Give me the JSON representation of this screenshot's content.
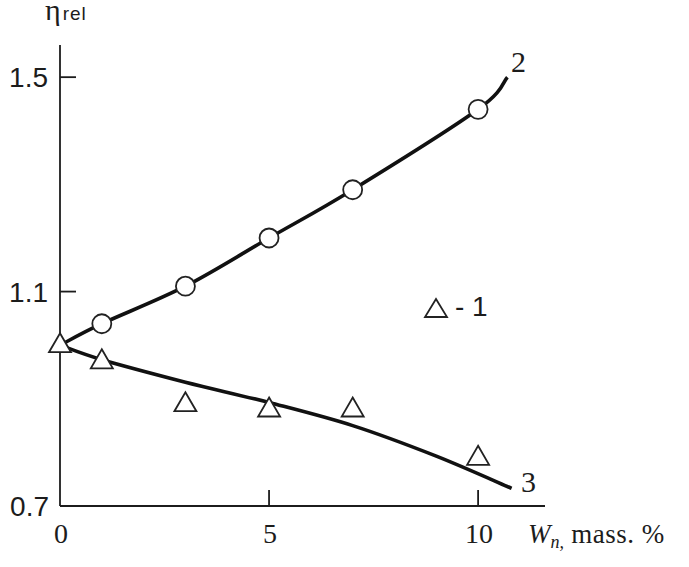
{
  "chart_data": {
    "type": "line",
    "title": "",
    "xlabel": "W_n, mass. %",
    "ylabel": "η_rel",
    "xlim": [
      0,
      11.6
    ],
    "ylim": [
      0.7,
      1.56
    ],
    "grid": false,
    "x_ticks": [
      0,
      5,
      10
    ],
    "x_tick_labels": [
      "0",
      "5",
      "10"
    ],
    "y_ticks": [
      0.7,
      1.1,
      1.5
    ],
    "y_tick_labels": [
      "0.7",
      "1.1",
      "1.5"
    ],
    "series": [
      {
        "name": "1",
        "kind": "points",
        "marker": "triangle",
        "x": [
          0,
          1,
          3,
          5,
          7,
          10
        ],
        "y": [
          1.0,
          0.97,
          0.89,
          0.88,
          0.88,
          0.79
        ]
      },
      {
        "name": "2-points",
        "kind": "points",
        "marker": "circle",
        "x": [
          1,
          3,
          5,
          7,
          10
        ],
        "y": [
          1.04,
          1.11,
          1.2,
          1.29,
          1.44
        ]
      },
      {
        "name": "2",
        "kind": "curve",
        "x": [
          0,
          1,
          3,
          5,
          7,
          10,
          10.7
        ],
        "y": [
          1.0,
          1.04,
          1.11,
          1.2,
          1.29,
          1.44,
          1.5
        ]
      },
      {
        "name": "3",
        "kind": "curve",
        "x": [
          0,
          1,
          3,
          5,
          7,
          9,
          10.8
        ],
        "y": [
          1.0,
          0.973,
          0.931,
          0.893,
          0.85,
          0.793,
          0.733
        ]
      }
    ],
    "annotations": [
      {
        "text": "2",
        "target": "curve 2"
      },
      {
        "text": "3",
        "target": "curve 3"
      }
    ],
    "legend": [
      {
        "marker": "triangle",
        "label": "- 1"
      }
    ],
    "legend_position": "inside right, middle"
  },
  "axes": {
    "y_label": {
      "symbol": "η",
      "subscript": "rel"
    },
    "x_label": {
      "symbol": "W",
      "subscript": "n,",
      "unit": " mass. %"
    }
  }
}
